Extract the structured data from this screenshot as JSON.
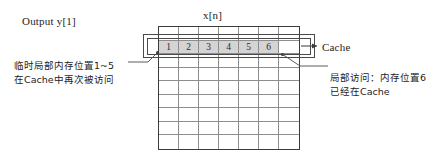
{
  "diagram": {
    "output_label": "Output y[1]",
    "array_label": "x[n]",
    "cache_label": "Cache",
    "left_note_line1": "临时局部内存位置1~5",
    "left_note_line2": "在Cache中再次被访问",
    "right_note_line1": "局部访问：内存位置6",
    "right_note_line2": "已经在Cache",
    "grid": {
      "columns": 7,
      "rows": 9,
      "highlight_row_index": 1,
      "shaded_cell_values": [
        "1",
        "2",
        "3",
        "4",
        "5",
        "6"
      ],
      "shaded_cell_count": 6
    },
    "colors": {
      "grid_border": "#3b3b3b",
      "grid_line": "#8d8d8d",
      "shaded_cell": "#d4d4d4",
      "cache_rect_border": "#4a4a4a",
      "text": "#1c1c1c",
      "background": "#ffffff"
    }
  }
}
